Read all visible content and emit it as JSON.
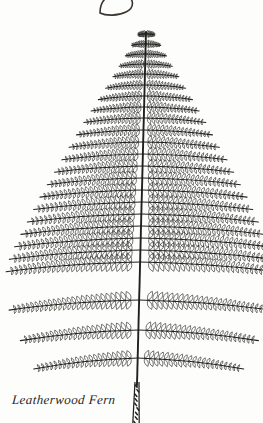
{
  "plate": {
    "caption": "Leatherwood Fern",
    "subject": "fern frond botanical illustration",
    "background_color": "#fdfdfb",
    "ink_color": "#20201c",
    "caption_color": "#2b2722"
  },
  "illustration": {
    "apex": {
      "x": 148,
      "y": 32
    },
    "base": {
      "x": 136,
      "y": 423
    },
    "rachis_top_x": 146,
    "rachis_bottom_x": 136,
    "blade_bottom_y": 388,
    "widest_y": 272,
    "left_extent": 2,
    "right_extent": 259,
    "pinna_pair_count": 24,
    "pinnule_min": 6,
    "pinnule_max": 26,
    "stipe_scale_count": 9
  },
  "chart_data": {
    "type": "line",
    "xlabel": "horizontal extent (px)",
    "ylabel": "vertical position (px)",
    "xlim": [
      0,
      263
    ],
    "ylim": [
      0,
      423
    ],
    "grid": false,
    "legend": "none",
    "series": [
      {
        "name": "pinna half-length (left)",
        "y": [
          34,
          44,
          54,
          64,
          74,
          85,
          96,
          107,
          118,
          130,
          142,
          154,
          166,
          178,
          190,
          202,
          214,
          226,
          238,
          250,
          262,
          300,
          330,
          358
        ],
        "values": [
          8,
          14,
          20,
          26,
          32,
          39,
          46,
          53,
          60,
          67,
          74,
          81,
          88,
          95,
          102,
          108,
          114,
          120,
          126,
          131,
          134,
          130,
          118,
          104
        ]
      },
      {
        "name": "pinna half-length (right)",
        "y": [
          34,
          44,
          54,
          64,
          74,
          85,
          96,
          107,
          118,
          130,
          142,
          154,
          166,
          178,
          190,
          202,
          214,
          226,
          238,
          250,
          262,
          300,
          330,
          358
        ],
        "values": [
          9,
          15,
          21,
          27,
          34,
          41,
          48,
          55,
          62,
          69,
          76,
          84,
          91,
          98,
          105,
          111,
          117,
          123,
          128,
          132,
          136,
          132,
          120,
          106
        ]
      }
    ]
  }
}
